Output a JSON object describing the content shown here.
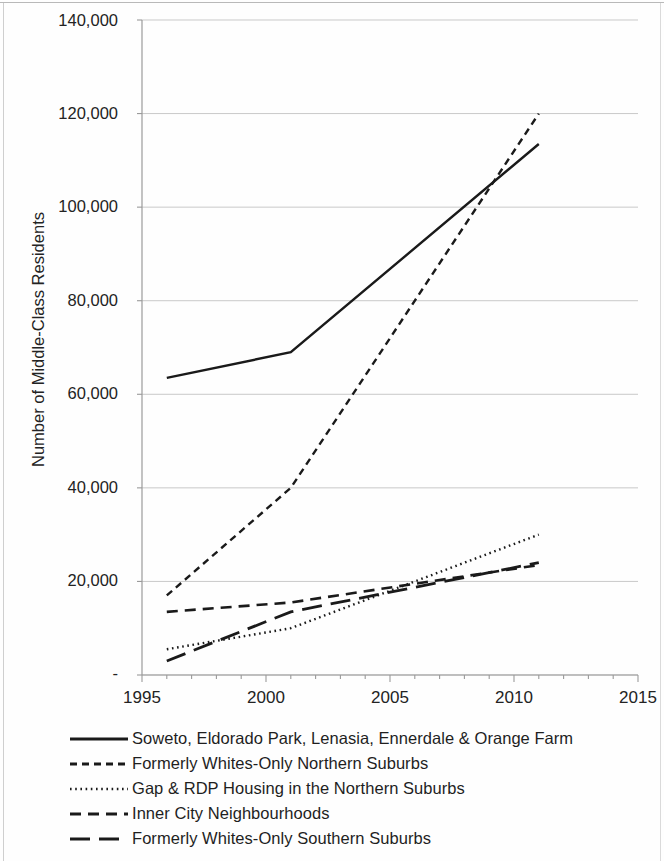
{
  "chart_data": {
    "type": "line",
    "title": "",
    "subtitle": "",
    "xlabel": "",
    "ylabel": "Number of Middle-Class Residents",
    "xlim": [
      1995,
      2015
    ],
    "ylim": [
      0,
      140000
    ],
    "x_ticks": [
      1995,
      2000,
      2005,
      2010,
      2015
    ],
    "x_tick_labels": [
      "1995",
      "2000",
      "2005",
      "2010",
      "2015"
    ],
    "x_minor_tick_interval": 1,
    "y_ticks": [
      0,
      20000,
      40000,
      60000,
      80000,
      100000,
      120000,
      140000
    ],
    "y_tick_labels": [
      "-",
      "20,000",
      "40,000",
      "60,000",
      "80,000",
      "100,000",
      "120,000",
      "140,000"
    ],
    "grid": "horizontal",
    "legend_position": "below",
    "series": [
      {
        "name": "Soweto, Eldorado Park, Lenasia, Ennerdale & Orange Farm",
        "style": "solid",
        "x": [
          1996,
          2001,
          2011
        ],
        "values": [
          63500,
          69000,
          113500
        ]
      },
      {
        "name": "Formerly Whites-Only Northern Suburbs",
        "style": "dashed-short",
        "x": [
          1996,
          2001,
          2011
        ],
        "values": [
          17000,
          40000,
          120000
        ]
      },
      {
        "name": "Gap & RDP Housing in the Northern Suburbs",
        "style": "dotted",
        "x": [
          1996,
          2001,
          2011
        ],
        "values": [
          5500,
          10000,
          30000
        ]
      },
      {
        "name": "Inner City Neighbourhoods",
        "style": "dashed-medium",
        "x": [
          1996,
          2001,
          2011
        ],
        "values": [
          13500,
          15500,
          23500
        ]
      },
      {
        "name": "Formerly Whites-Only Southern Suburbs",
        "style": "dashed-long",
        "x": [
          1996,
          2001,
          2011
        ],
        "values": [
          3000,
          13500,
          24000
        ]
      }
    ]
  },
  "axes": {
    "y_title": "Number of Middle-Class Residents",
    "y_labels": [
      "140,000",
      "120,000",
      "100,000",
      "80,000",
      "60,000",
      "40,000",
      "20,000",
      "-"
    ],
    "x_labels": [
      "1995",
      "2000",
      "2005",
      "2010",
      "2015"
    ]
  },
  "legend": {
    "items": [
      {
        "label": "Soweto, Eldorado Park, Lenasia, Ennerdale & Orange Farm",
        "style": "solid"
      },
      {
        "label": "Formerly Whites-Only Northern Suburbs",
        "style": "dashed-short"
      },
      {
        "label": "Gap & RDP Housing in the Northern Suburbs",
        "style": "dotted"
      },
      {
        "label": "Inner City Neighbourhoods",
        "style": "dashed-medium"
      },
      {
        "label": "Formerly Whites-Only Southern Suburbs",
        "style": "dashed-long"
      }
    ]
  },
  "colors": {
    "ink": "#1a1a1a",
    "grid": "#c9c9c9",
    "axis": "#9a9a9a",
    "background": "#ffffff"
  }
}
